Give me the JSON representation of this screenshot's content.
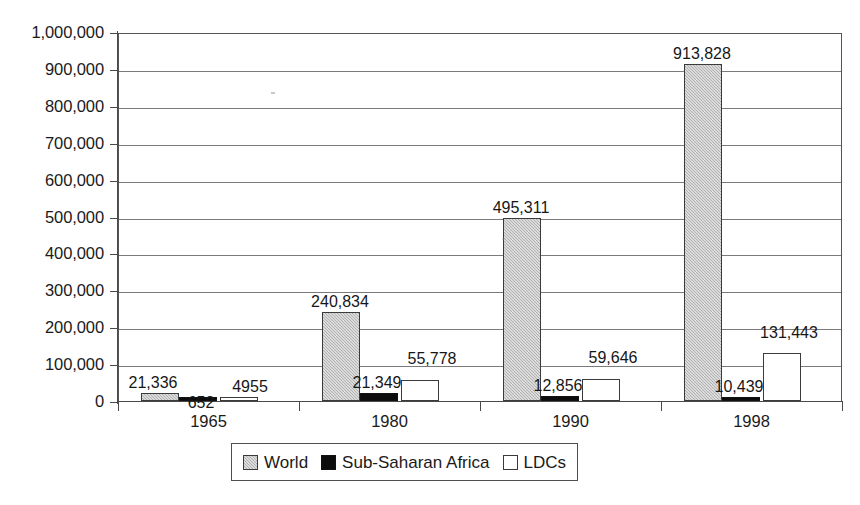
{
  "chart_data": {
    "type": "bar",
    "title": "",
    "subtitle": "",
    "xlabel": "",
    "ylabel": "",
    "categories": [
      "1965",
      "1980",
      "1990",
      "1998"
    ],
    "series": [
      {
        "name": "World",
        "values": [
          21336,
          240834,
          495311,
          913828
        ],
        "labels": [
          "21,336",
          "240,834",
          "495,311",
          "913,828"
        ],
        "color": "#b0b0b0",
        "fill": "light-gray-dither"
      },
      {
        "name": "Sub-Saharan Africa",
        "values": [
          652,
          21349,
          12856,
          10439
        ],
        "labels": [
          "652",
          "21,349",
          "12,856",
          "10,439"
        ],
        "color": "#0c0c0c",
        "fill": "solid-black"
      },
      {
        "name": "LDCs",
        "values": [
          4955,
          55778,
          59646,
          131443
        ],
        "labels": [
          "4955",
          "55,778",
          "59,646",
          "131,443"
        ],
        "color": "#ffffff",
        "fill": "white-outline"
      }
    ],
    "ylim": [
      0,
      1000000
    ],
    "ytick_step": 100000,
    "ytick_labels": [
      "1,000,000",
      "900,000",
      "800,000",
      "700,000",
      "600,000",
      "500,000",
      "400,000",
      "300,000",
      "200,000",
      "100,000",
      "0"
    ],
    "ytick_values": [
      1000000,
      900000,
      800000,
      700000,
      600000,
      500000,
      400000,
      300000,
      200000,
      100000,
      0
    ],
    "grid": true,
    "grid_axis": "y",
    "legend_position": "bottom",
    "legend_entries": [
      "World",
      "Sub-Saharan Africa",
      "LDCs"
    ]
  },
  "axes": {
    "y": {
      "ticks": [
        {
          "label": "1,000,000",
          "value": 1000000
        },
        {
          "label": "900,000",
          "value": 900000
        },
        {
          "label": "800,000",
          "value": 800000
        },
        {
          "label": "700,000",
          "value": 700000
        },
        {
          "label": "600,000",
          "value": 600000
        },
        {
          "label": "500,000",
          "value": 500000
        },
        {
          "label": "400,000",
          "value": 400000
        },
        {
          "label": "300,000",
          "value": 300000
        },
        {
          "label": "200,000",
          "value": 200000
        },
        {
          "label": "100,000",
          "value": 100000
        },
        {
          "label": "0",
          "value": 0
        }
      ]
    },
    "x": {
      "ticks": [
        {
          "label": "1965"
        },
        {
          "label": "1980"
        },
        {
          "label": "1990"
        },
        {
          "label": "1998"
        }
      ]
    }
  },
  "legend": {
    "items": [
      {
        "label": "World",
        "swatch": "light-gray-dither"
      },
      {
        "label": "Sub-Saharan Africa",
        "swatch": "solid-black"
      },
      {
        "label": "LDCs",
        "swatch": "white-outline"
      }
    ]
  }
}
